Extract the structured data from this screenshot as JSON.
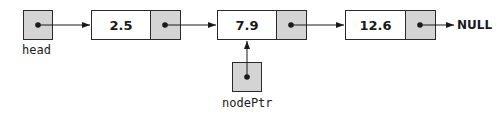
{
  "diagram": {
    "type": "linked-list",
    "head": {
      "label": "head"
    },
    "nodes": [
      {
        "value": "2.5"
      },
      {
        "value": "7.9"
      },
      {
        "value": "12.6"
      }
    ],
    "terminator": "NULL",
    "external_pointer": {
      "label": "nodePtr",
      "points_to_node_index": 1
    },
    "colors": {
      "pointer_fill": "#d4d4d4",
      "data_fill": "#ffffff",
      "stroke": "#2a2a2a"
    }
  }
}
